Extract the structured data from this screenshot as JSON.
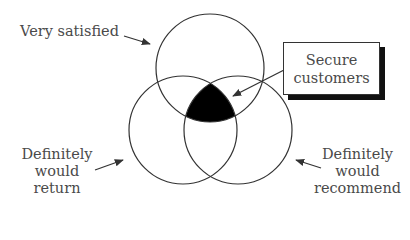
{
  "diagram": {
    "type": "venn-3",
    "sets": [
      {
        "id": "top",
        "label": "Very satisfied"
      },
      {
        "id": "left",
        "label_lines": [
          "Definitely",
          "would",
          "return"
        ]
      },
      {
        "id": "right",
        "label_lines": [
          "Definitely",
          "would",
          "recommend"
        ]
      }
    ],
    "intersection": {
      "label_lines": [
        "Secure",
        "customers"
      ],
      "fill": "#000000"
    },
    "colors": {
      "stroke": "#333333",
      "text": "#4a4a4a",
      "background": "#ffffff"
    }
  }
}
